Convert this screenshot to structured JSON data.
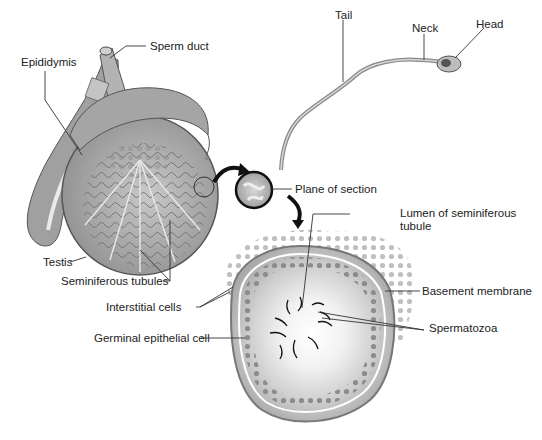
{
  "figure": {
    "type": "anatomical illustration"
  },
  "labels": {
    "sperm_duct": "Sperm duct",
    "epididymis": "Epididymis",
    "testis": "Testis",
    "seminiferous_tubules": "Seminiferous tubules",
    "interstitial_cells": "Interstitial cells",
    "germinal_epithelial_cell": "Germinal epithelial cell",
    "plane_of_section": "Plane of section",
    "lumen_line1": "Lumen of seminiferous",
    "lumen_line2": "tubule",
    "basement_membrane": "Basement membrane",
    "spermatozoa": "Spermatozoa",
    "tail": "Tail",
    "neck": "Neck",
    "head": "Head"
  },
  "colors": {
    "background": "#ffffff",
    "line": "#333333",
    "tissue_dark": "#8a8a8a",
    "tissue_mid": "#b5b5b5",
    "tissue_light": "#d6d6d6",
    "arrow": "#111111"
  }
}
